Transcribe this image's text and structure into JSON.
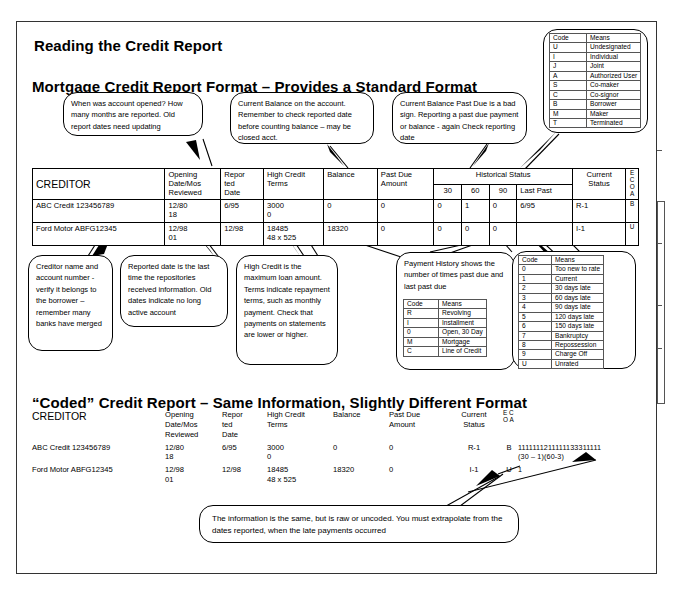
{
  "slide": {
    "title": "Reading the Credit Report",
    "section_mortgage": "Mortgage Credit Report Format – Provides a Standard Format",
    "section_coded": "“Coded” Credit Report – Same Information, Slightly Different Format"
  },
  "callouts": {
    "opening_date": "When was account opened? How many months are reported.  Old report dates need updating",
    "current_balance": "Current Balance on the account.  Remember to check reported date before counting balance – may be closed acct.",
    "past_due": "Current Balance Past Due is a bad sign. Reporting a past due payment or balance - again Check reporting date",
    "creditor_name": "Creditor name and account number - verify it belongs to the borrower – remember many banks have merged",
    "reported_date": "Reported date is the last time the repositories received information.  Old dates indicate no long active account",
    "high_credit": "High Credit is the maximum loan amount.  Terms indicate repayment terms, such as monthly payment. Check that payments on statements are lower or higher.",
    "payment_history": "Payment History shows the number of times past due and last past due",
    "bottom_note": "The information is the same, but is raw or uncoded.  You must extrapolate from the dates reported, when the late payments occurred"
  },
  "ecoa_table": {
    "headers": [
      "Code",
      "Means"
    ],
    "rows": [
      [
        "U",
        "Undesignated"
      ],
      [
        "I",
        "Individual"
      ],
      [
        "J",
        "Joint"
      ],
      [
        "A",
        "Authorized User"
      ],
      [
        "S",
        "Co-maker"
      ],
      [
        "C",
        "Co-signor"
      ],
      [
        "B",
        "Borrower"
      ],
      [
        "M",
        "Maker"
      ],
      [
        "T",
        "Terminated"
      ]
    ]
  },
  "account_type_table": {
    "headers": [
      "Code",
      "Means"
    ],
    "rows": [
      [
        "R",
        "Revolving"
      ],
      [
        "I",
        "Installment"
      ],
      [
        "0",
        "Open, 30 Day"
      ],
      [
        "M",
        "Mortgage"
      ],
      [
        "C",
        "Line of Credit"
      ]
    ]
  },
  "rating_table": {
    "headers": [
      "Code",
      "Means"
    ],
    "rows": [
      [
        "0",
        "Too new  to rate"
      ],
      [
        "1",
        "Current"
      ],
      [
        "2",
        "30 days late"
      ],
      [
        "3",
        "60 days late"
      ],
      [
        "4",
        "90 days late"
      ],
      [
        "5",
        "120 days late"
      ],
      [
        "6",
        "150 days late"
      ],
      [
        "7",
        "Bankruptcy"
      ],
      [
        "8",
        "Repossession"
      ],
      [
        "9",
        "Charge Off"
      ],
      [
        "U",
        "Unrated"
      ]
    ]
  },
  "report_table": {
    "headers": {
      "creditor": "CREDITOR",
      "opening": [
        "Opening",
        "Date/Mos",
        "Reviewed"
      ],
      "reported": [
        "Repor",
        "ted",
        "Date"
      ],
      "high_credit": [
        "High Credit",
        "Terms"
      ],
      "balance": "Balance",
      "past_due": [
        "Past Due",
        "Amount"
      ],
      "historical": "Historical Status",
      "hist_30": "30",
      "hist_60": "60",
      "hist_90": "90",
      "hist_last": "Last Past",
      "current_status": [
        "Current",
        "Status"
      ],
      "ecoa": [
        "E",
        "C",
        "O",
        "A"
      ]
    },
    "rows": [
      {
        "creditor": "ABC Credit 123456789",
        "opening": [
          "12/80",
          "18"
        ],
        "reported": "6/95",
        "high_credit": [
          "3000",
          "0"
        ],
        "balance": "0",
        "past_due": "0",
        "h30": "0",
        "h60": "1",
        "h90": "0",
        "last_past": "6/95",
        "current_status": "R-1",
        "ecoa": "B"
      },
      {
        "creditor": "Ford Motor ABFG12345",
        "opening": [
          "12/98",
          "01"
        ],
        "reported": "12/98",
        "high_credit": [
          "18485",
          "48 x 525"
        ],
        "balance": "18320",
        "past_due": "0",
        "h30": "0",
        "h60": "0",
        "h90": "0",
        "last_past": "",
        "current_status": "I-1",
        "ecoa": "U"
      }
    ]
  },
  "coded_table": {
    "headers": {
      "creditor": "CREDITOR",
      "opening": [
        "Opening",
        "Date/Mos",
        "Reviewed"
      ],
      "reported": [
        "Repor",
        "ted",
        "Date"
      ],
      "high_credit": [
        "High Credit",
        "Terms"
      ],
      "balance": "Balance",
      "past_due": [
        "Past Due",
        "Amount"
      ],
      "current_status": [
        "Current",
        "Status"
      ],
      "ecoa": [
        "E",
        "C",
        "O",
        "A"
      ]
    },
    "rows": [
      {
        "creditor": "ABC Credit 123456789",
        "opening": [
          "12/80",
          "18"
        ],
        "reported": "6/95",
        "high_credit": [
          "3000",
          "0"
        ],
        "balance": "0",
        "past_due": "0",
        "current_status": "R-1",
        "ecoa": "B",
        "history": [
          "1111111211111133311111",
          "(30 – 1)(60-3)"
        ]
      },
      {
        "creditor": "Ford Motor ABFG12345",
        "opening": [
          "12/98",
          "01"
        ],
        "reported": "12/98",
        "high_credit": [
          "18485",
          "48 x 525"
        ],
        "balance": "18320",
        "past_due": "0",
        "current_status": "I-1",
        "ecoa": "U",
        "history": [
          "1",
          ""
        ]
      }
    ]
  },
  "colors": {
    "ink": "#000000",
    "rule": "#555555",
    "page": "#ffffff"
  }
}
